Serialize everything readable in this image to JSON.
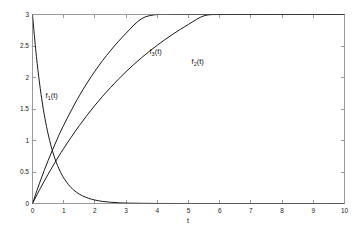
{
  "figure": {
    "background_color": "#ffffff",
    "axis_color": "#9a9a9a",
    "curve_color": "#1a1a1a"
  },
  "chart_data": {
    "type": "line",
    "title": "",
    "subtitle": "",
    "xlabel": "t",
    "ylabel": "",
    "xlim": [
      0,
      10
    ],
    "ylim": [
      0,
      3
    ],
    "xticks": [
      0,
      1,
      2,
      3,
      4,
      5,
      6,
      7,
      8,
      9,
      10
    ],
    "xticklabels": [
      "0",
      "1",
      "2",
      "3",
      "4",
      "5",
      "6",
      "7",
      "8",
      "9",
      "10"
    ],
    "yticks": [
      0,
      0.5,
      1,
      1.5,
      2,
      2.5,
      3
    ],
    "yticklabels": [
      "0",
      "0.5",
      "1",
      "1.5",
      "2",
      "2.5",
      "3"
    ],
    "grid": false,
    "legend": "inline-curve-labels",
    "box": true,
    "series": [
      {
        "name": "f_1(t)",
        "label_text": "f",
        "label_sub": "1",
        "label_suffix": "(t)",
        "label_x": 0.42,
        "label_y": 1.68,
        "x": [
          0,
          0.1,
          0.2,
          0.3,
          0.4,
          0.5,
          0.6,
          0.7,
          0.8,
          0.9,
          1,
          1.2,
          1.4,
          1.6,
          1.8,
          2,
          2.25,
          2.5,
          2.75,
          3,
          3.5,
          4,
          4.5,
          5,
          6,
          7,
          8,
          9,
          10
        ],
        "values": [
          3,
          2.456,
          2.011,
          1.646,
          1.348,
          1.104,
          0.904,
          0.74,
          0.606,
          0.496,
          0.406,
          0.272,
          0.182,
          0.122,
          0.082,
          0.055,
          0.033,
          0.02,
          0.012,
          0.007,
          0.003,
          0.001,
          0.0004,
          0.0001,
          0,
          0,
          0,
          0,
          0
        ]
      },
      {
        "name": "f_2(t)",
        "label_text": "f",
        "label_sub": "2",
        "label_suffix": "(t)",
        "label_x": 5.1,
        "label_y": 2.22,
        "x": [
          0,
          0.25,
          0.5,
          0.75,
          1,
          1.5,
          2,
          2.5,
          3,
          3.5,
          4,
          4.5,
          5,
          5.5,
          6,
          6.5,
          7,
          7.5,
          8,
          8.5,
          9,
          9.5,
          10
        ],
        "values": [
          0,
          0.239,
          0.464,
          0.675,
          0.874,
          1.236,
          1.557,
          1.841,
          2.093,
          2.316,
          2.513,
          2.688,
          2.843,
          2.98,
          3.102,
          3.21,
          3.305,
          3.39,
          3.465,
          3.531,
          3.59,
          3.642,
          3.688
        ]
      },
      {
        "name": "f_3(t)",
        "label_text": "f",
        "label_sub": "3",
        "label_suffix": "(t)",
        "label_x": 3.75,
        "label_y": 2.37,
        "x": [
          0,
          0.25,
          0.5,
          0.75,
          1,
          1.5,
          2,
          2.5,
          3,
          3.5,
          4,
          4.5,
          5,
          5.5,
          6,
          6.5,
          7,
          7.5,
          8,
          8.5,
          9,
          9.5,
          10
        ],
        "values": [
          0,
          0.357,
          0.681,
          0.975,
          1.243,
          1.71,
          2.1,
          2.427,
          2.703,
          2.935,
          3.13,
          3.294,
          3.432,
          3.548,
          3.646,
          3.728,
          3.797,
          3.856,
          3.905,
          3.946,
          3.981,
          4.01,
          4.034
        ]
      }
    ],
    "series_display_note": "f_2 and f_3 are rendered clipped to ylim [0,3]"
  }
}
